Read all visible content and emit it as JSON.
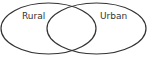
{
  "diagram": {
    "type": "venn",
    "sets": [
      {
        "label": "Rural"
      },
      {
        "label": "Urban"
      }
    ],
    "stroke_color": "#333333",
    "background": "#ffffff"
  }
}
